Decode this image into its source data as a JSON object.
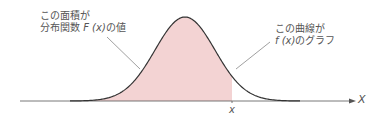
{
  "colors": {
    "fill": "#f3d3d3",
    "curve": "#333333",
    "axis": "#555555",
    "leader": "#888888",
    "text": "#555555"
  },
  "annotations": {
    "area": {
      "line1": "この面積が",
      "line2_prefix": "分布関数 ",
      "line2_func": "F (x)",
      "line2_suffix": "の値"
    },
    "curve": {
      "line1": "この曲線が",
      "line2_func": "f (x)",
      "line2_suffix": "のグラフ"
    }
  },
  "axis": {
    "x_label": "x",
    "axis_name": "X"
  },
  "distribution": {
    "type": "bell-curve",
    "shaded_region": "left of x"
  }
}
